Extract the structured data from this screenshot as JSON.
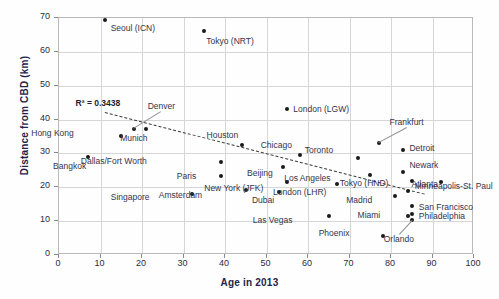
{
  "chart_data": {
    "type": "scatter",
    "title": "",
    "xlabel": "Age in 2013",
    "ylabel": "Distance from CBD (km)",
    "xlim": [
      0,
      100
    ],
    "ylim": [
      0,
      70
    ],
    "xticks": [
      0,
      10,
      20,
      30,
      40,
      50,
      60,
      70,
      80,
      90,
      100
    ],
    "yticks": [
      0,
      10,
      20,
      30,
      40,
      50,
      60,
      70
    ],
    "grid": true,
    "legend": "none",
    "annotation": "R² = 0.3438",
    "trendline": {
      "style": "dashed",
      "x_start": 11,
      "y_start": 42.3,
      "x_end": 88,
      "y_end": 18.2
    },
    "points": [
      {
        "label": "Seoul (ICN)",
        "x": 11,
        "y": 69.3,
        "label_dx": 6,
        "label_dy": 8
      },
      {
        "label": "Tokyo (NRT)",
        "x": 35,
        "y": 66.2,
        "label_dx": 2,
        "label_dy": 10
      },
      {
        "label": "Hong Kong",
        "x": 15,
        "y": 35.2,
        "label_dx": -53,
        "label_dy": -3
      },
      {
        "label": "Denver",
        "x": 18,
        "y": 37.2,
        "label_dx": 14,
        "label_dy": -23,
        "leader": true
      },
      {
        "label": "Munich",
        "x": 21,
        "y": 37.1,
        "label_dx": -5,
        "label_dy": 9
      },
      {
        "label": "Bangkok",
        "x": 7,
        "y": 29.0,
        "label_dx": -8,
        "label_dy": 9
      },
      {
        "label": "Dallas/Fort Worth",
        "x": 39,
        "y": 27.4,
        "label_dx": -80,
        "label_dy": -1
      },
      {
        "label": "Paris",
        "x": 39,
        "y": 23.2,
        "label_dx": -31,
        "label_dy": 0
      },
      {
        "label": "Singapore",
        "x": 32,
        "y": 17.9,
        "label_dx": -48,
        "label_dy": 3
      },
      {
        "label": "Amsterdam",
        "x": 45,
        "y": 19.2,
        "label_dx": -50,
        "label_dy": 5
      },
      {
        "label": "Houston",
        "x": 44,
        "y": 32.5,
        "label_dx": -9,
        "label_dy": -10
      },
      {
        "label": "London (LGW)",
        "x": 55,
        "y": 43.0,
        "label_dx": 6,
        "label_dy": 0
      },
      {
        "label": "Chicago",
        "x": 58,
        "y": 29.5,
        "label_dx": -14,
        "label_dy": -10
      },
      {
        "label": "Beijing",
        "x": 54,
        "y": 26.0,
        "label_dx": -16,
        "label_dy": 6
      },
      {
        "label": "New York (JFK)",
        "x": 55,
        "y": 21.5,
        "label_dx": -30,
        "label_dy": 6
      },
      {
        "label": "Dubai",
        "x": 53,
        "y": 18.5,
        "label_dx": -11,
        "label_dy": 8
      },
      {
        "label": "Las Vegas",
        "x": 65,
        "y": 11.5,
        "label_dx": -42,
        "label_dy": 4
      },
      {
        "label": "Toronto",
        "x": 72,
        "y": 28.7,
        "label_dx": -31,
        "label_dy": -8
      },
      {
        "label": "Los Angeles",
        "x": 75,
        "y": 23.6,
        "label_dx": -46,
        "label_dy": 3
      },
      {
        "label": "London (LHR)",
        "x": 67,
        "y": 21.0,
        "label_dx": -17,
        "label_dy": 8
      },
      {
        "label": "Frankfurt",
        "x": 77,
        "y": 33.0,
        "label_dx": 11,
        "label_dy": -21,
        "leader": true
      },
      {
        "label": "Detroit",
        "x": 83,
        "y": 31.0,
        "label_dx": 6,
        "label_dy": -2
      },
      {
        "label": "Newark",
        "x": 83,
        "y": 24.5,
        "label_dx": 6,
        "label_dy": -7
      },
      {
        "label": "Minneapolis-St. Paul",
        "x": 85,
        "y": 22.0,
        "label_dx": 3,
        "label_dy": 5
      },
      {
        "label": "Tokyo (HND)",
        "x": 92,
        "y": 21.5,
        "label_dx": -58,
        "label_dy": 1
      },
      {
        "label": "Madrid",
        "x": 81,
        "y": 17.4,
        "label_dx": -29,
        "label_dy": 4
      },
      {
        "label": "Atlanta",
        "x": 84,
        "y": 19.0,
        "label_dx": 4,
        "label_dy": -7
      },
      {
        "label": "San Francisco",
        "x": 85,
        "y": 14.6,
        "label_dx": 7,
        "label_dy": 1
      },
      {
        "label": "Philadelphia",
        "x": 85,
        "y": 12.0,
        "label_dx": 7,
        "label_dy": 2
      },
      {
        "label": "Miami",
        "x": 84,
        "y": 11.6,
        "label_dx": -33,
        "label_dy": -1
      },
      {
        "label": "Orlando",
        "x": 85,
        "y": 10.2,
        "label_dx": -4,
        "label_dy": 19,
        "leader": true
      },
      {
        "label": "Phoenix",
        "x": 78,
        "y": 5.5,
        "label_dx": -39,
        "label_dy": -3
      }
    ]
  }
}
